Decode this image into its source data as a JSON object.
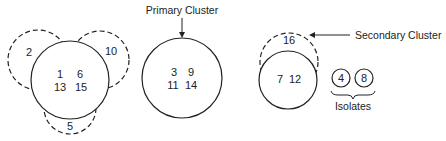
{
  "diagram": {
    "type": "cluster-diagram",
    "colors": {
      "stroke": "#222222",
      "background": "#ffffff"
    },
    "group_a": {
      "core_members": [
        "1",
        "6",
        "13",
        "15"
      ],
      "core_rows": [
        "1   6",
        "13  15"
      ],
      "satellites": [
        {
          "member": "2",
          "position": "upper-left",
          "style": "dashed"
        },
        {
          "member": "10",
          "position": "upper-right",
          "style": "dashed"
        },
        {
          "member": "5",
          "position": "bottom",
          "style": "dashed"
        }
      ]
    },
    "primary_cluster": {
      "label": "Primary Cluster",
      "members": [
        "3",
        "9",
        "11",
        "14"
      ],
      "rows": [
        "3   9",
        "11  14"
      ]
    },
    "secondary_cluster": {
      "label": "Secondary Cluster",
      "core_row": "7  12",
      "core_members": [
        "7",
        "12"
      ],
      "dashed_member": "16"
    },
    "isolates": {
      "label": "Isolates",
      "members": [
        "4",
        "8"
      ]
    }
  }
}
